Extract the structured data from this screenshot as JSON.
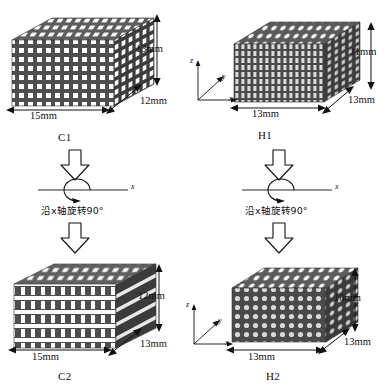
{
  "figure": {
    "type": "lattice-transformation-diagram",
    "background": "#ffffff",
    "ink": "#111111",
    "lattice_fill": "#4a4a4a"
  },
  "specimens": [
    {
      "id": "C1",
      "label": "C1",
      "cell_type": "square",
      "position": "top-left",
      "dims": {
        "width": "15mm",
        "depth": "12mm",
        "height": "13mm"
      }
    },
    {
      "id": "H1",
      "label": "H1",
      "cell_type": "honeycomb",
      "position": "top-right",
      "dims": {
        "width": "13mm",
        "depth": "13mm",
        "height": "11mm"
      }
    },
    {
      "id": "C2",
      "label": "C2",
      "cell_type": "square",
      "position": "bottom-left",
      "dims": {
        "width": "15mm",
        "depth": "13mm",
        "height": "12mm"
      }
    },
    {
      "id": "H2",
      "label": "H2",
      "cell_type": "honeycomb",
      "position": "bottom-right",
      "dims": {
        "width": "13mm",
        "depth": "13mm",
        "height": "10mm"
      }
    }
  ],
  "transforms": [
    {
      "id": "left-transform",
      "from": "C1",
      "to": "C2",
      "caption": "沿x轴旋转90°",
      "axis_label": "x",
      "symbol": "rotation-about-x-axis"
    },
    {
      "id": "right-transform",
      "from": "H1",
      "to": "H2",
      "caption": "沿x轴旋转90°",
      "axis_label": "x",
      "symbol": "rotation-about-x-axis"
    }
  ],
  "axis_triads": [
    {
      "id": "top-triad",
      "z": "z",
      "y": "y",
      "x": "x"
    },
    {
      "id": "bottom-triad",
      "z": "z",
      "y": "y",
      "x": "x"
    }
  ],
  "arrows": [
    {
      "id": "left-arrow-top",
      "direction": "down"
    },
    {
      "id": "left-arrow-bottom",
      "direction": "down"
    },
    {
      "id": "right-arrow-top",
      "direction": "down"
    },
    {
      "id": "right-arrow-bottom",
      "direction": "down"
    }
  ]
}
